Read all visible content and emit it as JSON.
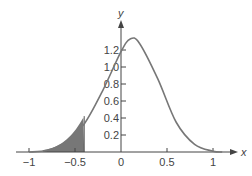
{
  "chart_data": {
    "type": "area",
    "title": "",
    "xlabel": "x",
    "ylabel": "y",
    "xlim": [
      -1.1,
      1.15
    ],
    "ylim": [
      0,
      1.4
    ],
    "grid": false,
    "legend": null,
    "x_ticks": [
      -1,
      -0.5,
      0,
      0.5,
      1
    ],
    "x_tick_labels": [
      "−1",
      "−0.5",
      "0",
      "0.5",
      "1"
    ],
    "y_ticks": [
      0.2,
      0.4,
      0.6,
      0.8,
      1.0,
      1.2
    ],
    "y_tick_labels": [
      "0.2",
      "0.4",
      "0.6",
      "0.8",
      "1.0",
      "1.2"
    ],
    "series": [
      {
        "name": "density curve",
        "description": "bell-shaped curve, peak about 1.33 near x = 0.1",
        "x": [
          -1.0,
          -0.8,
          -0.6,
          -0.4,
          -0.2,
          0.0,
          0.1,
          0.2,
          0.4,
          0.6,
          0.8,
          1.0,
          1.1
        ],
        "y": [
          0.0,
          0.02,
          0.12,
          0.33,
          0.72,
          1.18,
          1.33,
          1.28,
          0.86,
          0.35,
          0.09,
          0.01,
          0.0
        ]
      }
    ],
    "shaded_region": {
      "from_x": -0.85,
      "to_x": -0.4,
      "color": "#777777"
    }
  }
}
